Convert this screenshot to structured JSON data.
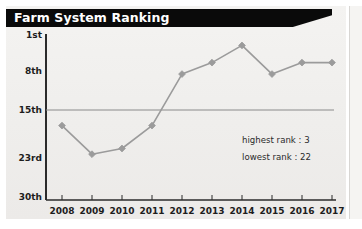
{
  "panel": {
    "title": "Farm System Ranking"
  },
  "annotations": {
    "highest": "highest rank : 3",
    "lowest": "lowest rank : 22"
  },
  "chart_data": {
    "type": "line",
    "title": "Farm System Ranking",
    "xlabel": "",
    "ylabel": "",
    "categories": [
      "2008",
      "2009",
      "2010",
      "2011",
      "2012",
      "2013",
      "2014",
      "2015",
      "2016",
      "2017"
    ],
    "values": [
      17,
      22,
      21,
      17,
      8,
      6,
      3,
      8,
      6,
      6
    ],
    "series": [
      {
        "name": "Farm System Ranking",
        "values": [
          17,
          22,
          21,
          17,
          8,
          6,
          3,
          8,
          6,
          6
        ],
        "color": "#9b9b9b",
        "marker": "diamond"
      }
    ],
    "y_ticks": [
      "1st",
      "8th",
      "15th",
      "23rd",
      "30th"
    ],
    "y_tick_values": [
      1,
      8,
      15,
      23,
      30
    ],
    "ylim": [
      1,
      30
    ],
    "y_inverted": true,
    "grid": false,
    "reference_line": {
      "value": 15,
      "label": "15th",
      "color": "#8a8a8a"
    },
    "legend": "none",
    "annotations": [
      "highest rank : 3",
      "lowest rank : 22"
    ]
  }
}
